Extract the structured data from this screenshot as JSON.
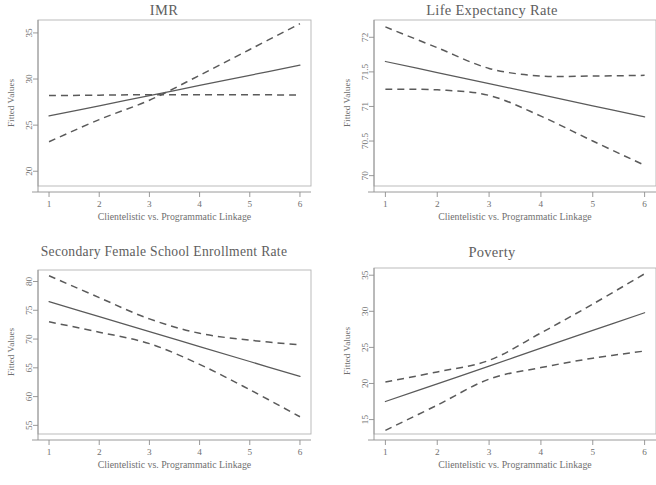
{
  "figure": {
    "panel_count": 4,
    "shared_xlabel": "Clientelistic vs. Programmatic Linkage",
    "shared_ylabel": "Fitted Values"
  },
  "panels": [
    {
      "id": "imr",
      "title": "IMR",
      "xlabel": "Clientelistic vs. Programmatic Linkage",
      "ylabel": "Fitted Values",
      "xticks": [
        "1",
        "2",
        "3",
        "4",
        "5",
        "6"
      ],
      "yticks": [
        "20",
        "25",
        "30",
        "35"
      ]
    },
    {
      "id": "life-expectancy-rate",
      "title": "Life Expectancy Rate",
      "xlabel": "Clientelistic vs. Programmatic Linkage",
      "ylabel": "Fitted Values",
      "xticks": [
        "1",
        "2",
        "3",
        "4",
        "5",
        "6"
      ],
      "yticks": [
        "70",
        "70.5",
        "71",
        "71.5",
        "72"
      ]
    },
    {
      "id": "secondary-female-school-enrollment-rate",
      "title": "Secondary Female School Enrollment Rate",
      "xlabel": "Clientelistic vs. Programmatic Linkage",
      "ylabel": "Fitted Values",
      "xticks": [
        "1",
        "2",
        "3",
        "4",
        "5",
        "6"
      ],
      "yticks": [
        "55",
        "60",
        "65",
        "70",
        "75",
        "80"
      ]
    },
    {
      "id": "poverty",
      "title": "Poverty",
      "xlabel": "Clientelistic vs. Programmatic Linkage",
      "ylabel": "Fitted Values",
      "xticks": [
        "1",
        "2",
        "3",
        "4",
        "5",
        "6"
      ],
      "yticks": [
        "15",
        "20",
        "25",
        "30",
        "35"
      ]
    }
  ],
  "chart_data": [
    {
      "type": "line",
      "title": "IMR",
      "xlabel": "Clientelistic vs. Programmatic Linkage",
      "ylabel": "Fitted Values",
      "xlim": [
        0.78,
        6.22
      ],
      "ylim": [
        18.4,
        36.4
      ],
      "xticks": [
        1,
        2,
        3,
        4,
        5,
        6
      ],
      "yticks": [
        20,
        25,
        30,
        35
      ],
      "grid": false,
      "legend": "none",
      "x": [
        1,
        2,
        3,
        4,
        5,
        6
      ],
      "series": [
        {
          "name": "Fitted line",
          "style": "solid",
          "values": [
            26.0,
            27.1,
            28.2,
            29.3,
            30.4,
            31.5
          ]
        },
        {
          "name": "Upper 95% CI",
          "style": "dashed",
          "values": [
            23.2,
            25.6,
            27.7,
            30.4,
            33.2,
            36.0
          ]
        },
        {
          "name": "Lower 95% CI",
          "style": "dashed",
          "values": [
            28.2,
            28.25,
            28.3,
            28.3,
            28.3,
            28.25
          ]
        }
      ]
    },
    {
      "type": "line",
      "title": "Life Expectancy Rate",
      "xlabel": "Clientelistic vs. Programmatic Linkage",
      "ylabel": "Fitted Values",
      "xlim": [
        0.78,
        6.22
      ],
      "ylim": [
        69.85,
        72.25
      ],
      "xticks": [
        1,
        2,
        3,
        4,
        5,
        6
      ],
      "yticks": [
        70,
        70.5,
        71,
        71.5,
        72
      ],
      "grid": false,
      "legend": "none",
      "x": [
        1,
        2,
        3,
        4,
        5,
        6
      ],
      "series": [
        {
          "name": "Fitted line",
          "style": "solid",
          "values": [
            71.65,
            71.49,
            71.33,
            71.17,
            71.01,
            70.85
          ]
        },
        {
          "name": "Upper 95% CI",
          "style": "dashed",
          "values": [
            72.15,
            71.85,
            71.55,
            71.44,
            71.44,
            71.45
          ]
        },
        {
          "name": "Lower 95% CI",
          "style": "dashed",
          "values": [
            71.25,
            71.24,
            71.16,
            70.86,
            70.5,
            70.15
          ]
        }
      ]
    },
    {
      "type": "line",
      "title": "Secondary Female School Enrollment Rate",
      "xlabel": "Clientelistic vs. Programmatic Linkage",
      "ylabel": "Fitted Values",
      "xlim": [
        0.78,
        6.22
      ],
      "ylim": [
        53.5,
        82.0
      ],
      "xticks": [
        1,
        2,
        3,
        4,
        5,
        6
      ],
      "yticks": [
        55,
        60,
        65,
        70,
        75,
        80
      ],
      "grid": false,
      "legend": "none",
      "x": [
        1,
        2,
        3,
        4,
        5,
        6
      ],
      "series": [
        {
          "name": "Fitted line",
          "style": "solid",
          "values": [
            76.5,
            73.9,
            71.3,
            68.7,
            66.1,
            63.5
          ]
        },
        {
          "name": "Upper 95% CI",
          "style": "dashed",
          "values": [
            81.0,
            77.2,
            73.5,
            71.0,
            69.8,
            69.0
          ]
        },
        {
          "name": "Lower 95% CI",
          "style": "dashed",
          "values": [
            73.0,
            71.2,
            69.2,
            65.6,
            61.2,
            56.5
          ]
        }
      ]
    },
    {
      "type": "line",
      "title": "Poverty",
      "xlabel": "Clientelistic vs. Programmatic Linkage",
      "ylabel": "Fitted Values",
      "xlim": [
        0.78,
        6.22
      ],
      "ylim": [
        13.0,
        36.0
      ],
      "xticks": [
        1,
        2,
        3,
        4,
        5,
        6
      ],
      "yticks": [
        15,
        20,
        25,
        30,
        35
      ],
      "grid": false,
      "legend": "none",
      "x": [
        1,
        2,
        3,
        4,
        5,
        6
      ],
      "series": [
        {
          "name": "Fitted line",
          "style": "solid",
          "values": [
            17.5,
            19.95,
            22.4,
            24.9,
            27.35,
            29.8
          ]
        },
        {
          "name": "Upper 95% CI",
          "style": "dashed",
          "values": [
            20.2,
            21.6,
            23.2,
            27.0,
            31.0,
            35.2
          ]
        },
        {
          "name": "Lower 95% CI",
          "style": "dashed",
          "values": [
            13.5,
            17.0,
            20.6,
            22.2,
            23.5,
            24.5
          ]
        }
      ]
    }
  ]
}
